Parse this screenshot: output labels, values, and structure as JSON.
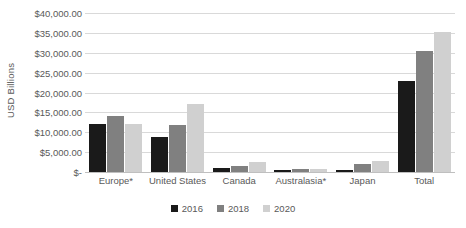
{
  "chart_data": {
    "type": "bar",
    "title": "",
    "xlabel": "",
    "ylabel": "USD Billions",
    "categories": [
      "Europe*",
      "United States",
      "Canada",
      "Australasia*",
      "Japan",
      "Total"
    ],
    "series": [
      {
        "name": "2016",
        "color": "#1a1a1a",
        "values": [
          12000,
          8700,
          1100,
          500,
          600,
          22800
        ]
      },
      {
        "name": "2018",
        "color": "#808080",
        "values": [
          14000,
          11800,
          1600,
          700,
          2100,
          30500
        ]
      },
      {
        "name": "2020",
        "color": "#d0d0d0",
        "values": [
          12000,
          17000,
          2400,
          800,
          2800,
          35100
        ]
      }
    ],
    "ylim": [
      0,
      40000
    ],
    "ytick_values": [
      0,
      5000,
      10000,
      15000,
      20000,
      25000,
      30000,
      35000,
      40000
    ],
    "ytick_labels": [
      "$-",
      "$5,000.00",
      "$10,000.00",
      "$15,000.00",
      "$20,000.00",
      "$25,000.00",
      "$30,000.00",
      "$35,000.00",
      "$40,000.00"
    ],
    "grid": true,
    "legend_position": "bottom",
    "gridline_color": "#d9d9d9",
    "text_color": "#595959",
    "background_color": "#ffffff"
  }
}
